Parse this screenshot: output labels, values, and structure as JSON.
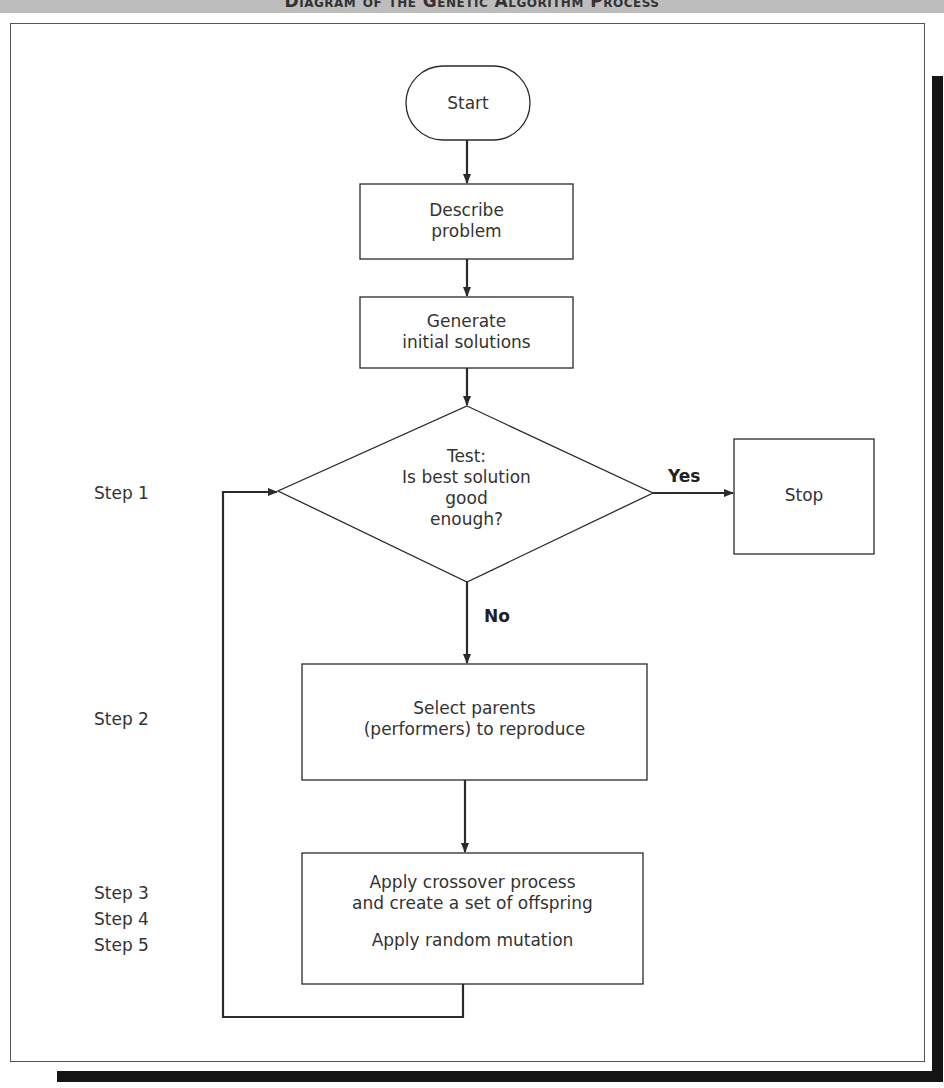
{
  "header": {
    "title": "Diagram of the Genetic Algorithm Process"
  },
  "colors": {
    "line": "#2a2a2a",
    "shadow": "#141414",
    "header_band": "#bdbdbd"
  },
  "nodes": {
    "start": "Start",
    "describe": {
      "line1": "Describe",
      "line2": "problem"
    },
    "generate": {
      "line1": "Generate",
      "line2": "initial solutions"
    },
    "test": {
      "line1": "Test:",
      "line2": "Is best solution",
      "line3": "good",
      "line4": "enough?"
    },
    "stop": "Stop",
    "select": {
      "line1": "Select parents",
      "line2": "(performers) to reproduce"
    },
    "apply": {
      "line1": "Apply crossover process",
      "line2": "and create a set of offspring",
      "line3": "Apply random mutation"
    }
  },
  "edges": {
    "yes": "Yes",
    "no": "No"
  },
  "steps": {
    "step1": "Step 1",
    "step2": "Step 2",
    "step3": "Step 3",
    "step4": "Step 4",
    "step5": "Step 5"
  }
}
